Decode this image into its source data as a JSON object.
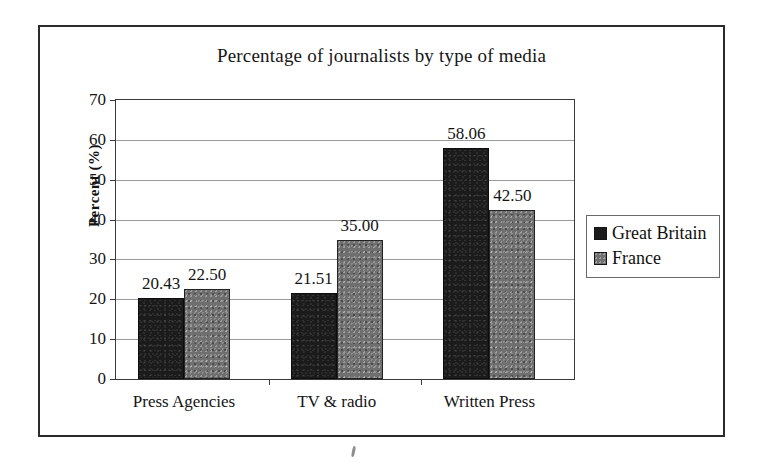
{
  "chart_data": {
    "type": "bar",
    "title": "Percentage of journalists by type of media",
    "xlabel": "",
    "ylabel": "Percent (%)",
    "categories": [
      "Press Agencies",
      "TV & radio",
      "Written Press"
    ],
    "series": [
      {
        "name": "Great Britain",
        "color": "#1b1b1b",
        "values": [
          20.43,
          21.51,
          58.06
        ],
        "labels": [
          "20.43",
          "21.51",
          "58.06"
        ]
      },
      {
        "name": "France",
        "color": "#6f6f6f",
        "values": [
          22.5,
          35.0,
          42.5
        ],
        "labels": [
          "22.50",
          "35.00",
          "42.50"
        ]
      }
    ],
    "ylim": [
      0,
      70
    ],
    "ytick_labels": [
      "70",
      "60",
      "50",
      "40",
      "30",
      "20",
      "10",
      "0"
    ],
    "ytick_values": [
      70,
      60,
      50,
      40,
      30,
      20,
      10,
      0
    ],
    "grid": true,
    "legend_position": "right",
    "legend_entries": [
      "Great Britain",
      "France"
    ]
  },
  "legend": {
    "items": [
      {
        "label": "Great Britain",
        "swatch": "black-square-icon"
      },
      {
        "label": "France",
        "swatch": "gray-square-icon"
      }
    ]
  }
}
